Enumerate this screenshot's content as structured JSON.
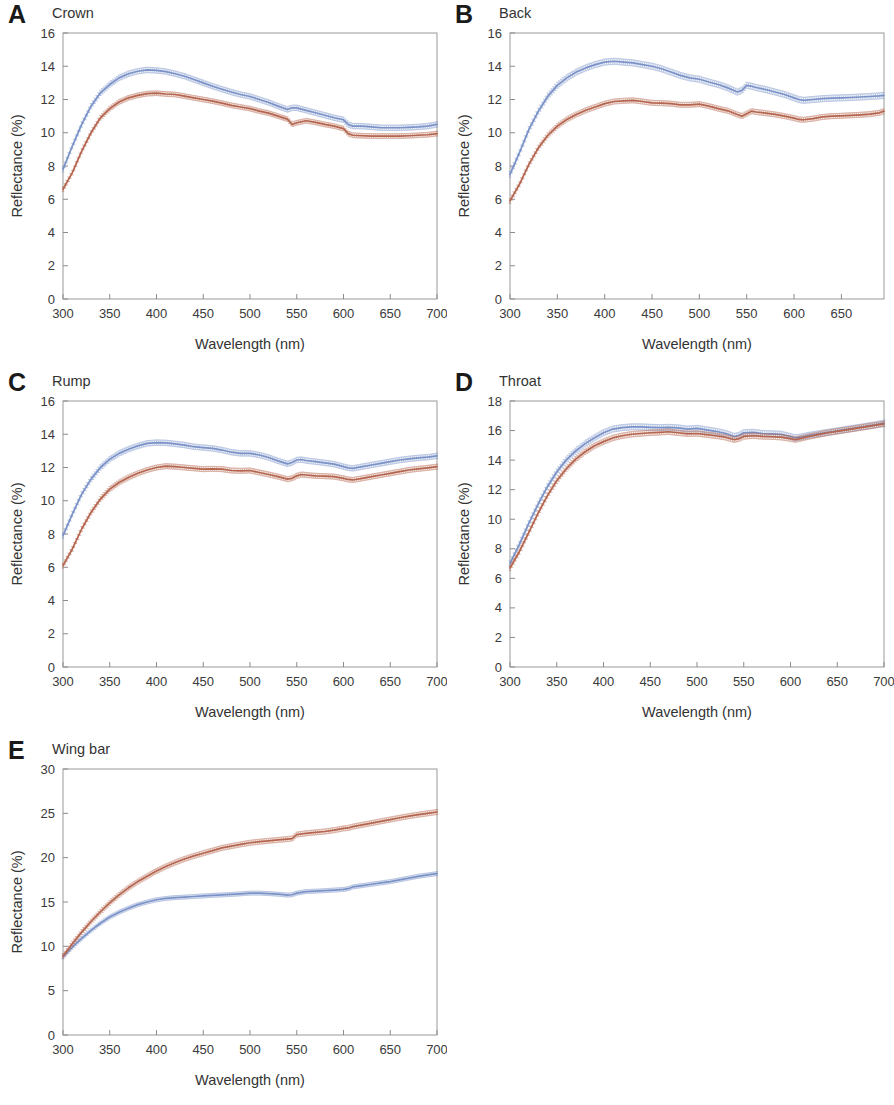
{
  "figure": {
    "axis_labels": {
      "x": "Wavelength (nm)",
      "y_percent": "Reflectance (%)"
    },
    "series_colors": {
      "blue": "#7a92c8",
      "red": "#b5654e"
    }
  },
  "panels": [
    {
      "letter": "A",
      "title": "Crown",
      "x_ticks": [
        "300",
        "350",
        "400",
        "450",
        "500",
        "550",
        "600",
        "650",
        "700"
      ],
      "y_ticks": [
        "0",
        "2",
        "4",
        "6",
        "8",
        "10",
        "12",
        "14",
        "16"
      ],
      "xlabel": "Wavelength (nm)",
      "ylabel": "Reflectance (%)"
    },
    {
      "letter": "B",
      "title": "Back",
      "x_ticks": [
        "300",
        "350",
        "400",
        "450",
        "500",
        "550",
        "600",
        "650"
      ],
      "y_ticks": [
        "0",
        "2",
        "4",
        "6",
        "8",
        "10",
        "12",
        "14",
        "16"
      ],
      "xlabel": "Wavelength (nm)",
      "ylabel": "Reflectance (%)"
    },
    {
      "letter": "C",
      "title": "Rump",
      "x_ticks": [
        "300",
        "350",
        "400",
        "450",
        "500",
        "550",
        "600",
        "650",
        "700"
      ],
      "y_ticks": [
        "0",
        "2",
        "4",
        "6",
        "8",
        "10",
        "12",
        "14",
        "16"
      ],
      "xlabel": "Wavelength (nm)",
      "ylabel": "Reflectance (%)"
    },
    {
      "letter": "D",
      "title": "Throat",
      "x_ticks": [
        "300",
        "350",
        "400",
        "450",
        "500",
        "550",
        "600",
        "650",
        "700"
      ],
      "y_ticks": [
        "0",
        "2",
        "4",
        "6",
        "8",
        "10",
        "12",
        "14",
        "16",
        "18"
      ],
      "xlabel": "Wavelength (nm)",
      "ylabel": "Reflectance (%)"
    },
    {
      "letter": "E",
      "title": "Wing bar",
      "x_ticks": [
        "300",
        "350",
        "400",
        "450",
        "500",
        "550",
        "600",
        "650",
        "700"
      ],
      "y_ticks": [
        "0",
        "5",
        "10",
        "15",
        "20",
        "25",
        "30"
      ],
      "xlabel": "Wavelength (nm)",
      "ylabel": "Reflectance (%)"
    }
  ],
  "chart_data": [
    {
      "type": "line",
      "panel": "A",
      "title": "Crown",
      "xlabel": "Wavelength (nm)",
      "ylabel": "Reflectance (%)",
      "xlim": [
        300,
        700
      ],
      "ylim": [
        0,
        16
      ],
      "xticks": [
        300,
        350,
        400,
        450,
        500,
        550,
        600,
        650,
        700
      ],
      "yticks": [
        0,
        2,
        4,
        6,
        8,
        10,
        12,
        14,
        16
      ],
      "grid": false,
      "legend": "none",
      "x": [
        300,
        310,
        320,
        330,
        340,
        350,
        360,
        370,
        380,
        390,
        400,
        410,
        420,
        430,
        440,
        450,
        460,
        470,
        480,
        490,
        500,
        510,
        520,
        530,
        540,
        545,
        550,
        560,
        570,
        580,
        590,
        600,
        605,
        610,
        620,
        630,
        640,
        650,
        660,
        670,
        680,
        690,
        700
      ],
      "series": [
        {
          "name": "blue",
          "color": "#7a92c8",
          "values": [
            7.8,
            9.2,
            10.5,
            11.6,
            12.4,
            12.9,
            13.3,
            13.55,
            13.7,
            13.78,
            13.75,
            13.68,
            13.55,
            13.4,
            13.2,
            13.0,
            12.8,
            12.62,
            12.45,
            12.3,
            12.18,
            12.0,
            11.82,
            11.6,
            11.4,
            11.5,
            11.5,
            11.35,
            11.2,
            11.05,
            10.9,
            10.78,
            10.5,
            10.4,
            10.4,
            10.35,
            10.3,
            10.3,
            10.3,
            10.32,
            10.35,
            10.4,
            10.5
          ],
          "err": 0.16
        },
        {
          "name": "red",
          "color": "#b5654e",
          "values": [
            6.6,
            7.6,
            8.9,
            10.0,
            10.9,
            11.45,
            11.85,
            12.1,
            12.25,
            12.35,
            12.38,
            12.33,
            12.3,
            12.2,
            12.1,
            12.0,
            11.9,
            11.78,
            11.65,
            11.55,
            11.45,
            11.3,
            11.18,
            11.0,
            10.82,
            10.5,
            10.6,
            10.72,
            10.62,
            10.5,
            10.4,
            10.25,
            9.95,
            9.85,
            9.82,
            9.8,
            9.8,
            9.8,
            9.8,
            9.82,
            9.85,
            9.88,
            9.95
          ],
          "err": 0.14
        }
      ]
    },
    {
      "type": "line",
      "panel": "B",
      "title": "Back",
      "xlabel": "Wavelength (nm)",
      "ylabel": "Reflectance (%)",
      "xlim": [
        300,
        695
      ],
      "ylim": [
        0,
        16
      ],
      "xticks": [
        300,
        350,
        400,
        450,
        500,
        550,
        600,
        650
      ],
      "yticks": [
        0,
        2,
        4,
        6,
        8,
        10,
        12,
        14,
        16
      ],
      "grid": false,
      "legend": "none",
      "x": [
        300,
        310,
        320,
        330,
        340,
        350,
        360,
        370,
        380,
        390,
        400,
        410,
        420,
        430,
        440,
        450,
        460,
        470,
        480,
        490,
        500,
        510,
        520,
        530,
        540,
        545,
        550,
        555,
        560,
        570,
        580,
        590,
        600,
        605,
        610,
        620,
        630,
        640,
        650,
        660,
        670,
        680,
        690,
        695
      ],
      "series": [
        {
          "name": "blue",
          "color": "#7a92c8",
          "values": [
            7.5,
            8.8,
            10.2,
            11.3,
            12.2,
            12.85,
            13.3,
            13.65,
            13.9,
            14.1,
            14.25,
            14.3,
            14.25,
            14.2,
            14.1,
            14.0,
            13.85,
            13.65,
            13.45,
            13.3,
            13.22,
            13.05,
            12.9,
            12.7,
            12.45,
            12.55,
            12.85,
            12.8,
            12.72,
            12.6,
            12.45,
            12.3,
            12.1,
            12.0,
            11.95,
            12.0,
            12.05,
            12.08,
            12.1,
            12.12,
            12.15,
            12.18,
            12.22,
            12.25
          ],
          "err": 0.18
        },
        {
          "name": "red",
          "color": "#b5654e",
          "values": [
            5.9,
            6.9,
            8.1,
            9.1,
            9.85,
            10.4,
            10.8,
            11.1,
            11.35,
            11.55,
            11.75,
            11.88,
            11.92,
            11.95,
            11.88,
            11.8,
            11.78,
            11.75,
            11.68,
            11.68,
            11.72,
            11.6,
            11.45,
            11.32,
            11.1,
            11.0,
            11.15,
            11.3,
            11.25,
            11.18,
            11.1,
            11.0,
            10.88,
            10.8,
            10.78,
            10.85,
            10.95,
            11.0,
            11.02,
            11.05,
            11.08,
            11.12,
            11.2,
            11.3
          ],
          "err": 0.15
        }
      ]
    },
    {
      "type": "line",
      "panel": "C",
      "title": "Rump",
      "xlabel": "Wavelength (nm)",
      "ylabel": "Reflectance (%)",
      "xlim": [
        300,
        700
      ],
      "ylim": [
        0,
        16
      ],
      "xticks": [
        300,
        350,
        400,
        450,
        500,
        550,
        600,
        650,
        700
      ],
      "yticks": [
        0,
        2,
        4,
        6,
        8,
        10,
        12,
        14,
        16
      ],
      "grid": false,
      "legend": "none",
      "x": [
        300,
        310,
        320,
        330,
        340,
        350,
        360,
        370,
        380,
        390,
        400,
        410,
        420,
        430,
        440,
        450,
        460,
        470,
        480,
        490,
        500,
        510,
        520,
        530,
        540,
        545,
        550,
        555,
        560,
        570,
        580,
        590,
        600,
        605,
        610,
        620,
        630,
        640,
        650,
        660,
        670,
        680,
        690,
        700
      ],
      "series": [
        {
          "name": "blue",
          "color": "#7a92c8",
          "values": [
            7.9,
            9.2,
            10.4,
            11.3,
            12.0,
            12.5,
            12.85,
            13.1,
            13.3,
            13.45,
            13.5,
            13.48,
            13.42,
            13.35,
            13.25,
            13.2,
            13.15,
            13.05,
            12.92,
            12.85,
            12.85,
            12.75,
            12.6,
            12.4,
            12.22,
            12.3,
            12.45,
            12.48,
            12.42,
            12.35,
            12.28,
            12.2,
            12.05,
            11.98,
            11.95,
            12.05,
            12.15,
            12.25,
            12.35,
            12.45,
            12.52,
            12.58,
            12.62,
            12.7
          ],
          "err": 0.16
        },
        {
          "name": "red",
          "color": "#b5654e",
          "values": [
            6.1,
            7.1,
            8.3,
            9.3,
            10.1,
            10.7,
            11.1,
            11.4,
            11.65,
            11.85,
            12.0,
            12.08,
            12.05,
            12.0,
            11.95,
            11.9,
            11.92,
            11.9,
            11.82,
            11.8,
            11.82,
            11.7,
            11.58,
            11.45,
            11.3,
            11.35,
            11.5,
            11.58,
            11.55,
            11.5,
            11.48,
            11.45,
            11.35,
            11.28,
            11.25,
            11.35,
            11.45,
            11.55,
            11.65,
            11.75,
            11.85,
            11.92,
            11.98,
            12.05
          ],
          "err": 0.15
        }
      ]
    },
    {
      "type": "line",
      "panel": "D",
      "title": "Throat",
      "xlabel": "Wavelength (nm)",
      "ylabel": "Reflectance (%)",
      "xlim": [
        300,
        700
      ],
      "ylim": [
        0,
        18
      ],
      "xticks": [
        300,
        350,
        400,
        450,
        500,
        550,
        600,
        650,
        700
      ],
      "yticks": [
        0,
        2,
        4,
        6,
        8,
        10,
        12,
        14,
        16,
        18
      ],
      "grid": false,
      "legend": "none",
      "x": [
        300,
        310,
        320,
        330,
        340,
        350,
        360,
        370,
        380,
        390,
        400,
        410,
        420,
        430,
        440,
        450,
        460,
        470,
        480,
        490,
        500,
        510,
        520,
        530,
        540,
        545,
        550,
        560,
        570,
        580,
        590,
        600,
        605,
        610,
        620,
        630,
        640,
        650,
        660,
        670,
        680,
        690,
        700
      ],
      "series": [
        {
          "name": "blue",
          "color": "#7a92c8",
          "values": [
            7.0,
            8.3,
            9.7,
            11.0,
            12.2,
            13.2,
            14.0,
            14.6,
            15.1,
            15.5,
            15.85,
            16.1,
            16.2,
            16.25,
            16.25,
            16.22,
            16.2,
            16.22,
            16.18,
            16.1,
            16.15,
            16.05,
            15.95,
            15.82,
            15.6,
            15.68,
            15.85,
            15.88,
            15.8,
            15.78,
            15.75,
            15.6,
            15.5,
            15.55,
            15.68,
            15.78,
            15.88,
            15.98,
            16.08,
            16.18,
            16.28,
            16.38,
            16.5
          ],
          "err": 0.2
        },
        {
          "name": "red",
          "color": "#b5654e",
          "values": [
            6.7,
            7.8,
            9.1,
            10.4,
            11.6,
            12.6,
            13.4,
            14.05,
            14.55,
            14.95,
            15.25,
            15.5,
            15.65,
            15.75,
            15.8,
            15.85,
            15.88,
            15.92,
            15.85,
            15.78,
            15.8,
            15.72,
            15.65,
            15.55,
            15.38,
            15.45,
            15.6,
            15.65,
            15.6,
            15.58,
            15.55,
            15.45,
            15.38,
            15.45,
            15.6,
            15.72,
            15.85,
            15.95,
            16.05,
            16.15,
            16.25,
            16.35,
            16.45
          ],
          "err": 0.18
        }
      ]
    },
    {
      "type": "line",
      "panel": "E",
      "title": "Wing bar",
      "xlabel": "Wavelength (nm)",
      "ylabel": "Reflectance (%)",
      "xlim": [
        300,
        700
      ],
      "ylim": [
        0,
        30
      ],
      "xticks": [
        300,
        350,
        400,
        450,
        500,
        550,
        600,
        650,
        700
      ],
      "yticks": [
        0,
        5,
        10,
        15,
        20,
        25,
        30
      ],
      "grid": false,
      "legend": "none",
      "x": [
        300,
        310,
        320,
        330,
        340,
        350,
        360,
        370,
        380,
        390,
        400,
        410,
        420,
        430,
        440,
        450,
        460,
        470,
        480,
        490,
        500,
        510,
        520,
        530,
        540,
        545,
        550,
        560,
        570,
        580,
        590,
        600,
        605,
        610,
        620,
        630,
        640,
        650,
        660,
        670,
        680,
        690,
        700
      ],
      "series": [
        {
          "name": "blue",
          "color": "#7a92c8",
          "values": [
            8.8,
            9.9,
            10.9,
            11.8,
            12.6,
            13.3,
            13.85,
            14.3,
            14.7,
            15.0,
            15.25,
            15.4,
            15.5,
            15.55,
            15.62,
            15.68,
            15.75,
            15.8,
            15.85,
            15.92,
            16.0,
            16.0,
            15.95,
            15.88,
            15.78,
            15.82,
            16.0,
            16.18,
            16.22,
            16.28,
            16.35,
            16.42,
            16.5,
            16.7,
            16.85,
            17.0,
            17.15,
            17.3,
            17.5,
            17.7,
            17.9,
            18.05,
            18.2
          ],
          "err": 0.22
        },
        {
          "name": "red",
          "color": "#b5654e",
          "values": [
            8.9,
            10.3,
            11.6,
            12.8,
            13.9,
            14.9,
            15.8,
            16.6,
            17.3,
            17.9,
            18.5,
            19.0,
            19.45,
            19.85,
            20.2,
            20.5,
            20.8,
            21.1,
            21.3,
            21.5,
            21.68,
            21.8,
            21.9,
            22.0,
            22.1,
            22.15,
            22.6,
            22.75,
            22.85,
            22.95,
            23.1,
            23.3,
            23.35,
            23.5,
            23.7,
            23.9,
            24.1,
            24.3,
            24.5,
            24.68,
            24.85,
            25.0,
            25.15
          ],
          "err": 0.28
        }
      ]
    }
  ]
}
